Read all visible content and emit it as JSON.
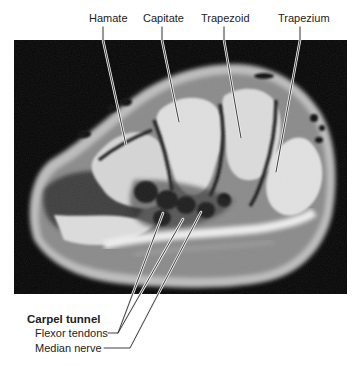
{
  "figure": {
    "type": "annotated axial MRI, wrist at carpal tunnel level",
    "top_labels": [
      {
        "text": "Hamate",
        "x": 89,
        "y": 12
      },
      {
        "text": "Capitate",
        "x": 143,
        "y": 12
      },
      {
        "text": "Trapezoid",
        "x": 201,
        "y": 12
      },
      {
        "text": "Trapezium",
        "x": 278,
        "y": 12
      }
    ],
    "bottom_labels": {
      "heading": "Carpel tunnel",
      "items": [
        {
          "text": "Flexor tendons"
        },
        {
          "text": "Median nerve"
        }
      ]
    },
    "colors": {
      "background": "#ffffff",
      "frame": "#050505",
      "leader_line": "#2a2a2a",
      "leader_halo": "#f2f2f2"
    }
  }
}
